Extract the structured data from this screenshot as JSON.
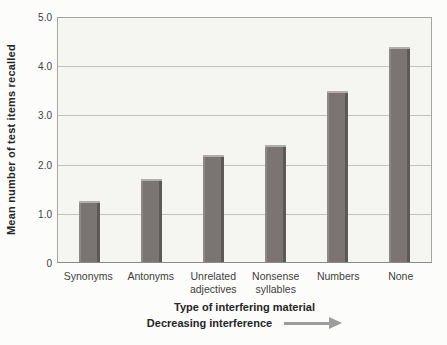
{
  "figure": {
    "bg_color": "#fcfcfa",
    "plot_bg_color": "#f5f5f1",
    "grid_color": "#c2c3bf",
    "border_color": "#a5a6a2",
    "bar_fill_color": "#7a7572",
    "bar_highlight_color": "#b2aeab",
    "bar_edge_color": "#8e8986",
    "bar_dark_color": "#5d5956",
    "arrow_color": "#9c9c9c",
    "text_color": "#3e3e3e",
    "title_color": "#262626"
  },
  "chart_data": {
    "type": "bar",
    "categories": [
      "Synonyms",
      "Antonyms",
      "Unrelated\nadjectives",
      "Nonsense\nsyllables",
      "Numbers",
      "None"
    ],
    "values": [
      1.25,
      1.7,
      2.2,
      2.4,
      3.5,
      4.4
    ],
    "ylabel": "Mean number of test items recalled",
    "xlabel": "Type of interfering material",
    "annotation": "Decreasing interference",
    "ylim": [
      0,
      5
    ],
    "yticks": [
      "5.0",
      "4.0",
      "3.0",
      "2.0",
      "1.0",
      "0"
    ],
    "grid": "horizontal gridlines at each whole number",
    "legend": "none",
    "title": ""
  }
}
